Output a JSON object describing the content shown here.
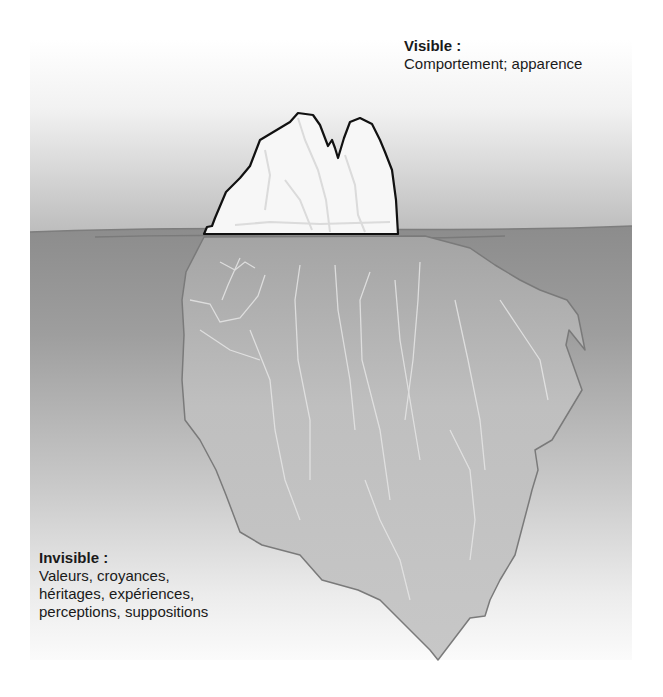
{
  "colors": {
    "sky_top": "#ffffff",
    "sky_bottom": "#bdbdbd",
    "water_top": "#8e8e8e",
    "water_bottom": "#f4f4f4",
    "ice_above": "#f7f7f7",
    "ice_below": "#c4c4c4",
    "outline_above": "#111111",
    "outline_below": "#777777",
    "text": "#1a1a1a"
  },
  "visible": {
    "title": "Visible :",
    "text": "Comportement; apparence"
  },
  "invisible": {
    "title": "Invisible :",
    "lines": [
      "Valeurs, croyances,",
      "héritages, expériences,",
      "perceptions, suppositions"
    ]
  },
  "icons": {
    "iceberg": "iceberg-illustration"
  }
}
